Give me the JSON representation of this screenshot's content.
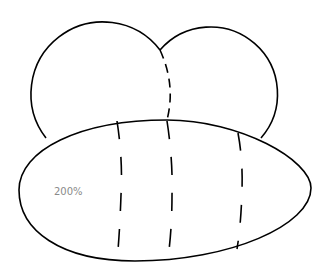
{
  "diagram": {
    "label": "200%",
    "stroke_color": "#000000",
    "label_color": "#8a8a8a",
    "shapes": [
      "left-lobe",
      "right-lobe",
      "body-ellipse",
      "stripe-1",
      "stripe-2",
      "stripe-3"
    ]
  }
}
